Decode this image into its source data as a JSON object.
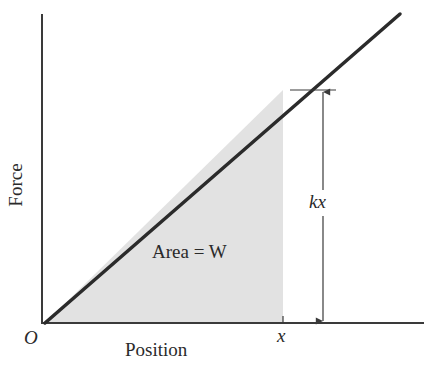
{
  "diagram": {
    "axes": {
      "x_label": "Position",
      "y_label": "Force",
      "origin_label": "O",
      "x_marker_label": "x"
    },
    "shaded_region": {
      "label": "Area = W",
      "fill_color": "#e2e2e2"
    },
    "dimension": {
      "label": "kx"
    },
    "colors": {
      "line": "#2b2b2b",
      "axis": "#3a3a3a",
      "text": "#2a2a2a",
      "background": "#ffffff"
    }
  }
}
